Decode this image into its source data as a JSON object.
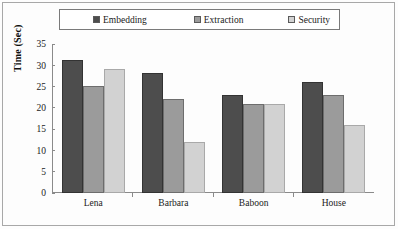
{
  "chart_data": {
    "type": "bar",
    "title": "",
    "subtitle": "",
    "xlabel": "",
    "ylabel": "Time (Sec)",
    "categories": [
      "Lena",
      "Barbara",
      "Baboon",
      "House"
    ],
    "series": [
      {
        "name": "Embedding",
        "color": "#4d4d4d",
        "values": [
          31.3,
          28.2,
          23.1,
          26.0
        ]
      },
      {
        "name": "Extraction",
        "color": "#9b9b9b",
        "values": [
          25.2,
          22.1,
          21.0,
          23.0
        ]
      },
      {
        "name": "Security",
        "color": "#d2d2d2",
        "values": [
          29.2,
          12.0,
          21.0,
          16.0
        ]
      }
    ],
    "ylim": [
      0,
      35
    ],
    "yticks": [
      0,
      5,
      10,
      15,
      20,
      25,
      30,
      35
    ],
    "ytick_labels": [
      "0",
      "5",
      "10",
      "15",
      "20",
      "25",
      "30",
      "35"
    ],
    "grid": false,
    "legend_position": "top",
    "legend": [
      "Embedding",
      "Extraction",
      "Security"
    ],
    "frame": true
  }
}
